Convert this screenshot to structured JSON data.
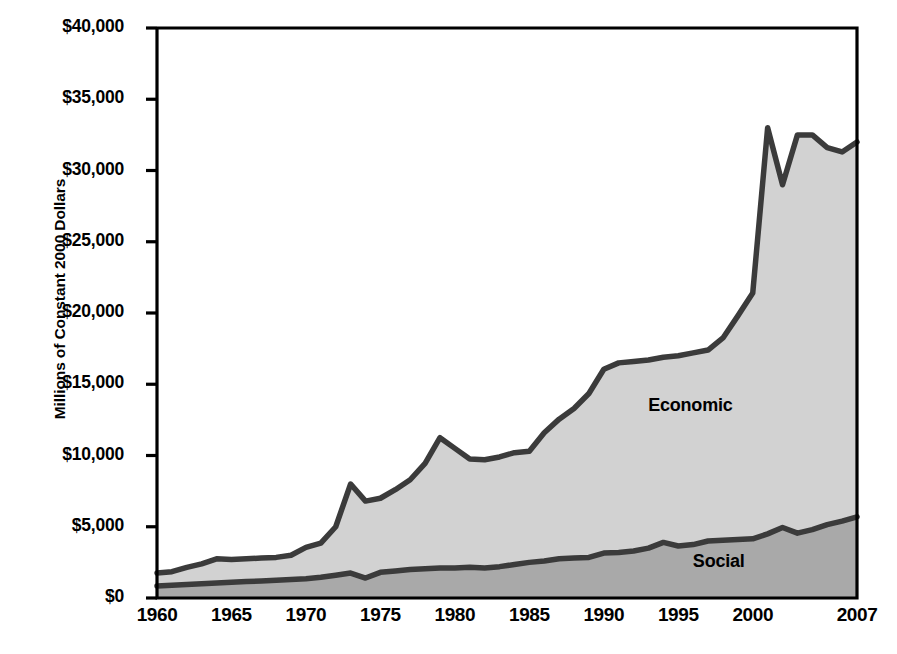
{
  "chart_data": {
    "type": "area",
    "stacked": true,
    "title": "",
    "xlabel": "",
    "ylabel": "Millions of Constant 2000 Dollars",
    "xlim": [
      1960,
      2007
    ],
    "ylim": [
      0,
      40000
    ],
    "grid": false,
    "legend_position": "inline-annotation",
    "y_ticks": [
      0,
      5000,
      10000,
      15000,
      20000,
      25000,
      30000,
      35000,
      40000
    ],
    "y_tick_labels": [
      "$0",
      "$5,000",
      "$10,000",
      "$15,000",
      "$20,000",
      "$25,000",
      "$30,000",
      "$35,000",
      "$40,000"
    ],
    "x_ticks": [
      1960,
      1965,
      1970,
      1975,
      1980,
      1985,
      1990,
      1995,
      2000,
      2007
    ],
    "x_tick_labels": [
      "1960",
      "1965",
      "1970",
      "1975",
      "1980",
      "1985",
      "1990",
      "1995",
      "2000",
      "2007"
    ],
    "x": [
      1960,
      1961,
      1962,
      1963,
      1964,
      1965,
      1966,
      1967,
      1968,
      1969,
      1970,
      1971,
      1972,
      1973,
      1974,
      1975,
      1976,
      1977,
      1978,
      1979,
      1980,
      1981,
      1982,
      1983,
      1984,
      1985,
      1986,
      1987,
      1988,
      1989,
      1990,
      1991,
      1992,
      1993,
      1994,
      1995,
      1996,
      1997,
      1998,
      1999,
      2000,
      2001,
      2002,
      2003,
      2004,
      2005,
      2006,
      2007
    ],
    "series": [
      {
        "name": "Social",
        "label": "Social",
        "fill_color": "#a9a9a9",
        "line_color": "#3b3b3b",
        "values": [
          850,
          900,
          950,
          1000,
          1050,
          1100,
          1150,
          1200,
          1250,
          1300,
          1350,
          1450,
          1600,
          1750,
          1400,
          1800,
          1900,
          2000,
          2050,
          2100,
          2100,
          2150,
          2100,
          2200,
          2350,
          2500,
          2600,
          2750,
          2800,
          2850,
          3150,
          3200,
          3300,
          3500,
          3900,
          3650,
          3750,
          4000,
          4050,
          4100,
          4150,
          4500,
          4950,
          4550,
          4800,
          5150,
          5400,
          5700
        ]
      },
      {
        "name": "Economic",
        "label": "Economic",
        "fill_color": "#d2d2d2",
        "line_color": "#3b3b3b",
        "values": [
          900,
          950,
          1200,
          1400,
          1700,
          1600,
          1600,
          1600,
          1600,
          1700,
          2200,
          2400,
          3400,
          6250,
          5400,
          5200,
          5700,
          6300,
          7400,
          9150,
          8400,
          7600,
          7600,
          7700,
          7850,
          7800,
          9000,
          9800,
          10500,
          11500,
          12900,
          13300,
          13300,
          13200,
          13000,
          13350,
          13450,
          13400,
          14200,
          15700,
          17250,
          28500,
          24050,
          27950,
          27700,
          26450,
          25900,
          26300
        ]
      }
    ],
    "totals": [
      1750,
      1850,
      2150,
      2400,
      2750,
      2700,
      2750,
      2800,
      2850,
      3000,
      3550,
      3850,
      5000,
      8000,
      6800,
      7000,
      7600,
      8300,
      9450,
      11250,
      10500,
      9750,
      9700,
      9900,
      10200,
      10300,
      11600,
      12550,
      13300,
      14350,
      16050,
      16500,
      16600,
      16700,
      16900,
      17000,
      17200,
      17400,
      18250,
      19800,
      21400,
      33000,
      29000,
      32500,
      32500,
      31600,
      31300,
      32000
    ],
    "annotations": [
      {
        "text": "Economic",
        "x": 1996,
        "y": 13500
      },
      {
        "text": "Social",
        "x": 1999,
        "y": 2500
      }
    ]
  },
  "axes": {
    "frame_color": "#000000",
    "tick_color": "#000000"
  }
}
